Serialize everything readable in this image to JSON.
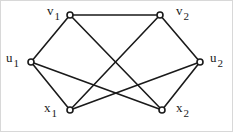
{
  "figure": {
    "width": 233,
    "height": 132,
    "background_color": "#ffffff",
    "edge_color": "#1a1a1a",
    "node_stroke_color": "#1a1a1a",
    "node_fill_color": "#ffffff",
    "frame_color": "#d8d8d8",
    "label_color": "#1a1a1a"
  },
  "chart_data": {
    "type": "diagram",
    "diagram_kind": "undirected-graph",
    "title": "",
    "node_count": 6,
    "edge_count": 9,
    "degree_sequence": [
      3,
      3,
      3,
      3,
      3,
      3
    ],
    "nodes": [
      {
        "id": "v1",
        "base": "v",
        "sub": "1",
        "x": 70,
        "y": 15,
        "label_x": 47,
        "label_y": 4,
        "marker": "open-circle"
      },
      {
        "id": "v2",
        "base": "v",
        "sub": "2",
        "x": 160,
        "y": 15,
        "label_x": 176,
        "label_y": 4,
        "marker": "open-circle"
      },
      {
        "id": "u1",
        "base": "u",
        "sub": "1",
        "x": 31,
        "y": 62,
        "label_x": 6,
        "label_y": 51,
        "marker": "open-circle"
      },
      {
        "id": "u2",
        "base": "u",
        "sub": "2",
        "x": 200,
        "y": 62,
        "label_x": 210,
        "label_y": 51,
        "marker": "open-circle"
      },
      {
        "id": "x1",
        "base": "x",
        "sub": "1",
        "x": 70,
        "y": 110,
        "label_x": 44,
        "label_y": 101,
        "marker": "open-circle"
      },
      {
        "id": "x2",
        "base": "x",
        "sub": "2",
        "x": 162,
        "y": 110,
        "label_x": 176,
        "label_y": 101,
        "marker": "open-circle"
      }
    ],
    "edges": [
      {
        "from": "v1",
        "to": "v2"
      },
      {
        "from": "v1",
        "to": "u1"
      },
      {
        "from": "v1",
        "to": "x2"
      },
      {
        "from": "v2",
        "to": "u2"
      },
      {
        "from": "v2",
        "to": "x1"
      },
      {
        "from": "u1",
        "to": "x1"
      },
      {
        "from": "u1",
        "to": "x2"
      },
      {
        "from": "u2",
        "to": "x1"
      },
      {
        "from": "u2",
        "to": "x2"
      }
    ]
  }
}
